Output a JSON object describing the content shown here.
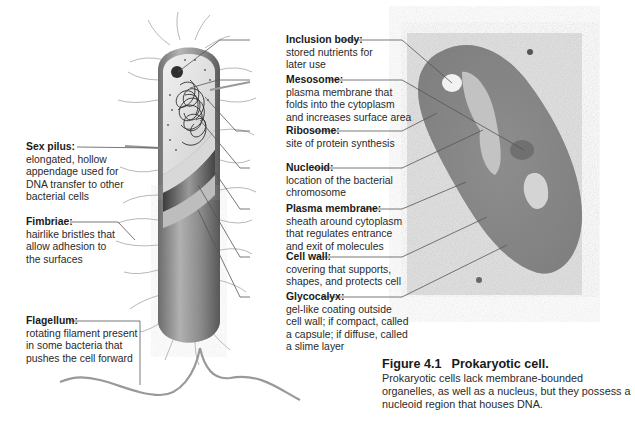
{
  "figure": {
    "number": "Figure 4.1",
    "title": "Prokaryotic cell.",
    "caption": "Prokaryotic cells lack membrane-bounded organelles, as well as a nucleus, but they possess a nucleoid region that houses DNA."
  },
  "labels_left": [
    {
      "title": "Sex pilus:",
      "desc": "elongated, hollow\nappendage used for\nDNA transfer to other\nbacterial cells"
    },
    {
      "title": "Fimbriae:",
      "desc": "hairlike bristles that\nallow adhesion to\nthe surfaces"
    },
    {
      "title": "Flagellum:",
      "desc": "rotating filament present\nin some bacteria that\npushes the cell forward"
    }
  ],
  "labels_right": [
    {
      "title": "Inclusion body:",
      "desc": "stored nutrients for\nlater use"
    },
    {
      "title": "Mesosome:",
      "desc": "plasma membrane that\nfolds into the cytoplasm\nand increases surface area"
    },
    {
      "title": "Ribosome:",
      "desc": "site of protein synthesis"
    },
    {
      "title": "Nucleoid:",
      "desc": "location of the bacterial\nchromosome"
    },
    {
      "title": "Plasma membrane:",
      "desc": "sheath around cytoplasm\nthat regulates entrance\nand exit of molecules"
    },
    {
      "title": "Cell wall:",
      "desc": "covering that supports,\nshapes, and protects cell"
    },
    {
      "title": "Glycocalyx:",
      "desc": "gel-like coating outside\ncell wall; if compact, called\na capsule; if diffuse, called\na slime layer"
    }
  ],
  "images": {
    "illustration": "bacterial-cell-cutaway-illustration",
    "micrograph": "prokaryotic-cell-electron-micrograph"
  },
  "colors": {
    "leader_line": "#555555",
    "micrograph_bg": "#e9e9e9",
    "cell_body": "#8a8a8a"
  }
}
